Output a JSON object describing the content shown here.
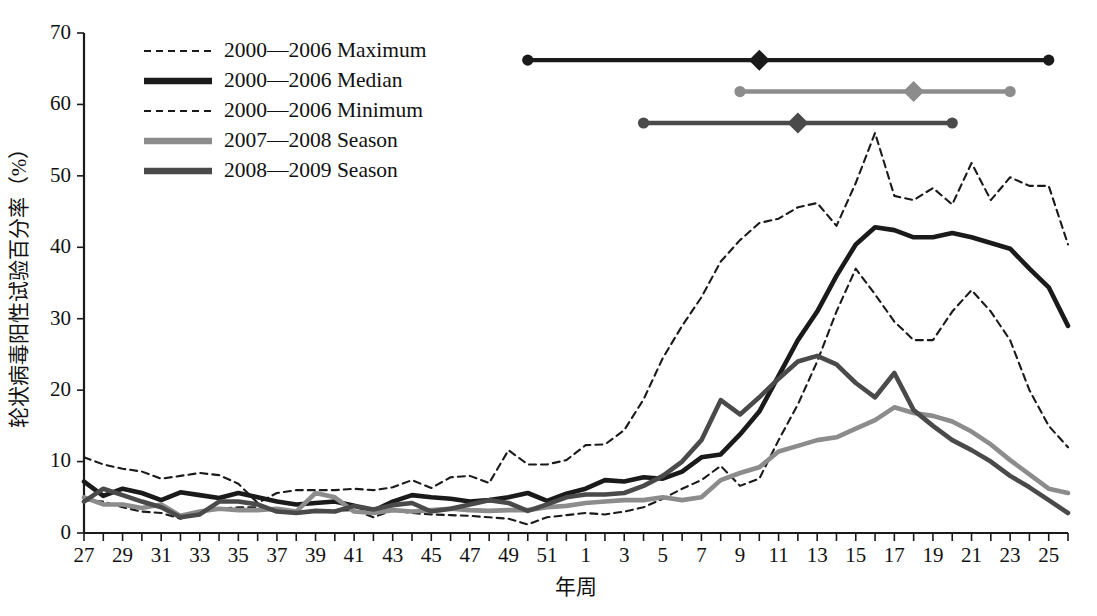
{
  "chart_data": {
    "type": "line",
    "title": "",
    "xlabel": "年周",
    "ylabel": "轮状病毒阳性试验百分率（%）",
    "xlim": [
      27,
      78
    ],
    "ylim": [
      0,
      70
    ],
    "yticks": [
      0,
      10,
      20,
      30,
      40,
      50,
      60,
      70
    ],
    "xtick_labels": [
      "27",
      "29",
      "31",
      "33",
      "35",
      "37",
      "39",
      "41",
      "43",
      "45",
      "47",
      "49",
      "51",
      "1",
      "3",
      "5",
      "7",
      "9",
      "11",
      "13",
      "15",
      "17",
      "19",
      "21",
      "23",
      "25"
    ],
    "x_weeks": [
      27,
      28,
      29,
      30,
      31,
      32,
      33,
      34,
      35,
      36,
      37,
      38,
      39,
      40,
      41,
      42,
      43,
      44,
      45,
      46,
      47,
      48,
      49,
      50,
      51,
      52,
      1,
      2,
      3,
      4,
      5,
      6,
      7,
      8,
      9,
      10,
      11,
      12,
      13,
      14,
      15,
      16,
      17,
      18,
      19,
      20,
      21,
      22,
      23,
      24,
      25,
      26
    ],
    "grid": false,
    "legend_position": "top-left",
    "colors": {
      "maximum": "#1a1a1a",
      "median": "#1a1a1a",
      "minimum": "#1a1a1a",
      "season_2007_2008": "#8c8c8c",
      "season_2008_2009": "#4a4a4a"
    },
    "series": [
      {
        "name": "2000—2006 Maximum",
        "style": "dashed",
        "color": "#1a1a1a",
        "values": [
          10.6,
          9.6,
          9.0,
          8.6,
          7.6,
          8.0,
          8.4,
          8.1,
          6.9,
          4.2,
          5.6,
          6.0,
          6.0,
          6.0,
          6.2,
          6.0,
          6.4,
          7.4,
          6.3,
          7.8,
          8.0,
          7.0,
          11.6,
          9.6,
          9.6,
          10.2,
          12.3,
          12.4,
          14.4,
          18.7,
          24.5,
          29.0,
          33.0,
          38.0,
          41.0,
          43.4,
          44.0,
          45.6,
          46.2,
          43.0,
          49.0,
          56.0,
          47.2,
          46.6,
          48.3,
          46.0,
          51.8,
          46.6,
          49.8,
          48.6,
          48.6,
          40.4
        ]
      },
      {
        "name": "2000—2006 Median",
        "style": "solid",
        "color": "#1a1a1a",
        "values": [
          7.2,
          5.2,
          6.2,
          5.6,
          4.6,
          5.7,
          5.3,
          4.9,
          5.6,
          5.0,
          4.4,
          4.0,
          4.2,
          4.4,
          3.8,
          3.1,
          4.4,
          5.3,
          5.0,
          4.8,
          4.4,
          4.6,
          5.0,
          5.6,
          4.5,
          5.5,
          6.2,
          7.4,
          7.2,
          7.8,
          7.6,
          8.6,
          10.6,
          11.0,
          13.8,
          17.0,
          22.0,
          27.0,
          31.0,
          36.0,
          40.4,
          42.8,
          42.4,
          41.4,
          41.4,
          42.0,
          41.4,
          40.6,
          39.8,
          37.0,
          34.4,
          29.0
        ]
      },
      {
        "name": "2000—2006 Minimum",
        "style": "dashed",
        "color": "#1a1a1a",
        "values": [
          4.6,
          4.4,
          3.6,
          3.0,
          2.8,
          2.0,
          3.0,
          3.4,
          3.6,
          3.6,
          3.0,
          2.8,
          3.0,
          3.1,
          3.2,
          2.2,
          3.2,
          2.8,
          2.6,
          2.5,
          2.4,
          2.2,
          2.0,
          1.2,
          2.2,
          2.5,
          2.8,
          2.6,
          3.0,
          3.6,
          4.8,
          6.2,
          7.4,
          9.4,
          6.6,
          7.6,
          13.0,
          18.0,
          24.0,
          31.0,
          37.0,
          33.4,
          29.6,
          27.0,
          27.0,
          31.0,
          34.0,
          31.0,
          27.0,
          20.0,
          15.0,
          12.0
        ]
      },
      {
        "name": "2007—2008 Season",
        "style": "solid",
        "color": "#8c8c8c",
        "values": [
          5.0,
          4.0,
          4.0,
          3.5,
          4.0,
          2.4,
          3.0,
          3.4,
          3.2,
          3.2,
          3.4,
          3.0,
          5.6,
          5.0,
          3.0,
          2.8,
          3.2,
          3.0,
          3.2,
          3.4,
          3.2,
          3.1,
          3.2,
          3.2,
          3.6,
          3.8,
          4.2,
          4.4,
          4.6,
          4.6,
          5.0,
          4.6,
          5.0,
          7.4,
          8.4,
          9.2,
          11.4,
          12.2,
          13.0,
          13.4,
          14.6,
          15.8,
          17.6,
          16.8,
          16.4,
          15.6,
          14.2,
          12.4,
          10.2,
          8.2,
          6.2,
          5.6
        ]
      },
      {
        "name": "2008—2009 Season",
        "style": "solid",
        "color": "#4a4a4a",
        "values": [
          4.4,
          6.2,
          5.3,
          4.4,
          3.6,
          2.2,
          2.6,
          4.4,
          4.4,
          4.0,
          3.0,
          2.8,
          3.1,
          3.0,
          3.8,
          3.3,
          3.9,
          4.2,
          3.0,
          3.4,
          4.0,
          4.6,
          4.2,
          3.1,
          4.0,
          5.0,
          5.4,
          5.4,
          5.6,
          6.6,
          8.0,
          10.0,
          13.0,
          18.6,
          16.6,
          19.0,
          21.6,
          24.0,
          24.8,
          23.6,
          21.0,
          19.0,
          22.4,
          17.2,
          15.0,
          13.0,
          11.6,
          10.0,
          8.0,
          6.4,
          4.6,
          2.8
        ]
      }
    ],
    "interval_bars": [
      {
        "name": "2000—2006 Median season interval",
        "color": "#1a1a1a",
        "y_value": 66.2,
        "start_week": 50,
        "mid_week": 62,
        "end_week": 77
      },
      {
        "name": "2007—2008 Season interval",
        "color": "#8c8c8c",
        "y_value": 61.8,
        "start_week": 61,
        "mid_week": 70,
        "end_week": 75
      },
      {
        "name": "2008—2009 Season interval",
        "color": "#4a4a4a",
        "y_value": 57.4,
        "start_week": 56,
        "mid_week": 64,
        "end_week": 72
      }
    ]
  },
  "legend": {
    "items": [
      {
        "label": "2000—2006 Maximum",
        "style": "dashed",
        "color": "#1a1a1a"
      },
      {
        "label": "2000—2006 Median",
        "style": "solid",
        "color": "#1a1a1a"
      },
      {
        "label": "2000—2006 Minimum",
        "style": "dashed",
        "color": "#1a1a1a"
      },
      {
        "label": "2007—2008 Season",
        "style": "solid",
        "color": "#8c8c8c"
      },
      {
        "label": "2008—2009 Season",
        "style": "solid",
        "color": "#4a4a4a"
      }
    ]
  }
}
